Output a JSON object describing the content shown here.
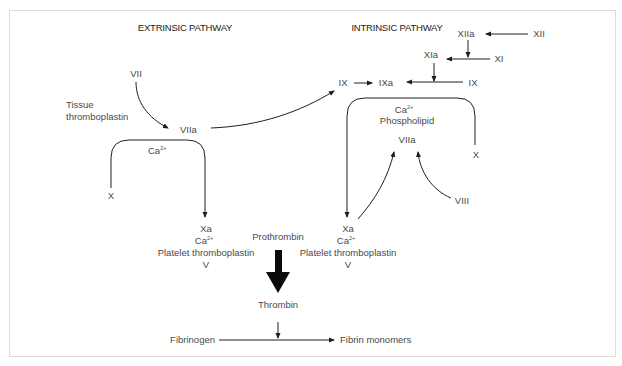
{
  "headers": {
    "extrinsic": "EXTRINSIC PATHWAY",
    "intrinsic": "INTRINSIC PATHWAY"
  },
  "extrinsic": {
    "vii": "VII",
    "tissue_line1": "Tissue",
    "tissue_line2": "thromboplastin",
    "viia": "VIIa",
    "ca": "Ca",
    "ca_sup": "2+",
    "x": "X",
    "complex": {
      "xa": "Xa",
      "ca": "Ca",
      "ca_sup": "2+",
      "platelet": "Platelet thromboplastin",
      "v": "V"
    }
  },
  "intrinsic": {
    "xiia": "XIIa",
    "xii": "XII",
    "xia": "XIa",
    "xi": "XI",
    "ix_left": "IX",
    "ixa": "IXa",
    "ix_right": "IX",
    "ca": "Ca",
    "ca_sup": "2+",
    "phospholipid": "Phospholipid",
    "viia": "VIIa",
    "x": "X",
    "viii": "VIII",
    "complex": {
      "xa": "Xa",
      "ca": "Ca",
      "ca_sup": "2+",
      "platelet": "Platelet thromboplastin",
      "v": "V"
    }
  },
  "common": {
    "prothrombin": "Prothrombin",
    "thrombin": "Thrombin",
    "fibrinogen": "Fibrinogen",
    "fibrin_monomers": "Fibrin monomers"
  }
}
